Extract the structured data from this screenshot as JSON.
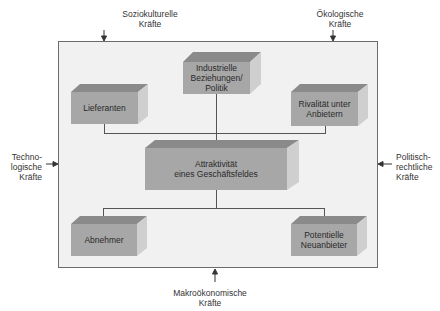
{
  "diagram": {
    "title": "",
    "center": "Attraktivität\neines Geschäftsfeldes",
    "inner_boxes": {
      "top_center": "Industrielle\nBeziehungen/\nPolitik",
      "top_left": "Lieferanten",
      "top_right": "Rivalität unter\nAnbietern",
      "bottom_left": "Abnehmer",
      "bottom_right": "Potentielle\nNeuanbieter"
    },
    "external_forces": {
      "top_left": "Soziokulturelle\nKräfte",
      "top_right": "Ökologische\nKräfte",
      "left": "Techno-\nlogische\nKräfte",
      "right": "Politisch-\nrechtliche\nKräfte",
      "bottom": "Makroökonomische\nKräfte"
    },
    "colors": {
      "frame_bg": "#f1f1f1",
      "box_front": "#a7a7a7",
      "box_top": "#8a8a8a",
      "box_side": "#cfcfcf",
      "lines": "#555555"
    }
  }
}
